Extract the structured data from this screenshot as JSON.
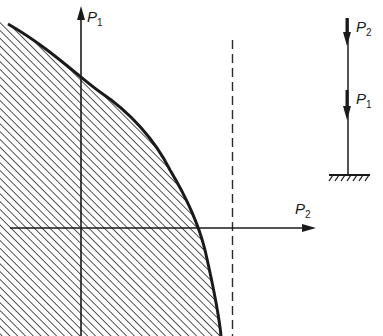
{
  "diagram": {
    "type": "interaction-diagram",
    "axes": {
      "vertical": {
        "label": "P",
        "subscript": "1"
      },
      "horizontal": {
        "label": "P",
        "subscript": "2"
      }
    },
    "region": {
      "fill": "diagonal-hatch",
      "boundary": "convex curve (stability limit)"
    },
    "asymptote": {
      "style": "dashed",
      "orientation": "vertical"
    },
    "inset": {
      "title": "column",
      "loads": [
        {
          "label": "P",
          "subscript": "2",
          "position": "top",
          "direction": "down"
        },
        {
          "label": "P",
          "subscript": "1",
          "position": "middle",
          "direction": "down"
        }
      ],
      "support": "fixed"
    },
    "colors": {
      "ink": "#1a1a1a",
      "background": "#ffffff"
    }
  }
}
